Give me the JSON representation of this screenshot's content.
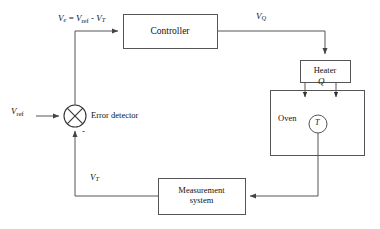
{
  "diagram": {
    "line_color": "#555555",
    "text_color": "#111111",
    "background": "#ffffff"
  },
  "blocks": {
    "controller": {
      "label": "Controller",
      "x": 123,
      "y": 14,
      "w": 94,
      "h": 34
    },
    "heater": {
      "label": "Heater",
      "x": 300,
      "y": 60,
      "w": 50,
      "h": 22
    },
    "oven": {
      "label": "Oven",
      "x": 270,
      "y": 90,
      "w": 94,
      "h": 65
    },
    "measurement": {
      "label": "Measurement\nsystem",
      "x": 158,
      "y": 178,
      "w": 87,
      "h": 36
    }
  },
  "summing_junction": {
    "name": "error-detector",
    "label": "Error detector",
    "minus_sign": "-",
    "cx": 75,
    "cy": 116,
    "r": 11
  },
  "sensor": {
    "label": "T",
    "cx": 318,
    "cy": 124,
    "r": 9
  },
  "signals": {
    "error_expression": {
      "v": "V",
      "e": "e",
      "equals": "=",
      "v_ref": "V",
      "ref": "ref",
      "minus": "-",
      "v_t": "V",
      "t": "T"
    },
    "v_ref": {
      "v": "V",
      "sub": "ref"
    },
    "v_q": {
      "v": "V",
      "sub": "Q"
    },
    "v_t": {
      "v": "V",
      "sub": "T"
    },
    "heat_flow": {
      "symbol": "Q"
    }
  }
}
